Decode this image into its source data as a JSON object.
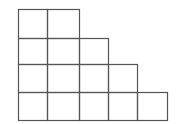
{
  "diagram": {
    "type": "young-diagram",
    "row_lengths": [
      2,
      3,
      4,
      5
    ],
    "x_lines": [
      18,
      47,
      79,
      108,
      137,
      167
    ],
    "y_lines": [
      9,
      38,
      64,
      92,
      120
    ],
    "stroke_color": "#555555",
    "background": "#ffffff"
  }
}
